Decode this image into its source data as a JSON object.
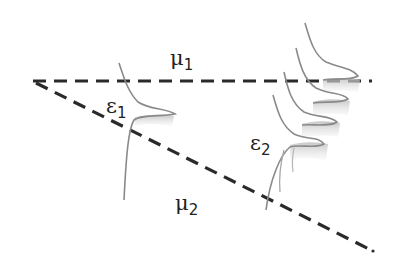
{
  "diagram": {
    "labels": {
      "mu1": {
        "symbol": "μ",
        "sub": "1"
      },
      "mu2": {
        "symbol": "μ",
        "sub": "2"
      },
      "eps1": {
        "symbol": "ε",
        "sub": "1"
      },
      "eps2": {
        "symbol": "ε",
        "sub": "2"
      }
    },
    "lines": {
      "horizontal": "μ1 mean line (dashed)",
      "diagonal": "μ2 mean line (dashed, descending)"
    },
    "colors": {
      "line": "#2a2a2a",
      "curve": "#8a8a8a",
      "shade": "#c8c8c8",
      "background": "#ffffff"
    }
  }
}
